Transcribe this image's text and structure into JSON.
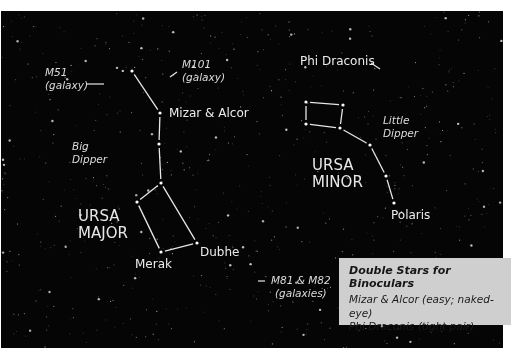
{
  "colors": {
    "sky": "#050505",
    "lines": "#e6e6e6",
    "label": "#e6e6e6",
    "info_box_bg": "#cfcfcf",
    "info_box_text": "#151515"
  },
  "labels": {
    "m51": [
      "M51",
      "(galaxy)"
    ],
    "m101": [
      "M101",
      "(galaxy)"
    ],
    "mizar_alcor": "Mizar & Alcor",
    "big_dipper": [
      "Big",
      "Dipper"
    ],
    "ursa_major": [
      "URSA",
      "MAJOR"
    ],
    "merak": "Merak",
    "dubhe": "Dubhe",
    "m81_m82": [
      "M81 & M82",
      "(galaxies)"
    ],
    "phi_draconis": "Phi Draconis",
    "little_dipper": [
      "Little",
      "Dipper"
    ],
    "ursa_minor": [
      "URSA",
      "MINOR"
    ],
    "polaris": "Polaris"
  },
  "info_box": {
    "title": "Double Stars for Binoculars",
    "lines": [
      "Mizar & Alcor (easy; naked-eye)",
      "Phi Draconis (tight pair)"
    ]
  },
  "constellations": {
    "big_dipper": {
      "stars": [
        [
          131,
          60
        ],
        [
          159,
          102
        ],
        [
          158,
          133
        ],
        [
          160,
          172
        ],
        [
          136,
          191
        ],
        [
          160,
          241
        ],
        [
          196,
          232
        ]
      ],
      "segments": [
        [
          0,
          1
        ],
        [
          1,
          2
        ],
        [
          2,
          3
        ],
        [
          3,
          4
        ],
        [
          4,
          5
        ],
        [
          5,
          6
        ],
        [
          6,
          3
        ]
      ]
    },
    "little_dipper": {
      "stars": [
        [
          305,
          91
        ],
        [
          342,
          94
        ],
        [
          339,
          117
        ],
        [
          305,
          113
        ],
        [
          369,
          134
        ],
        [
          385,
          165
        ],
        [
          393,
          192
        ]
      ],
      "segments": [
        [
          0,
          1
        ],
        [
          1,
          2
        ],
        [
          2,
          3
        ],
        [
          3,
          0
        ],
        [
          2,
          4
        ],
        [
          4,
          5
        ],
        [
          5,
          6
        ]
      ]
    }
  },
  "pointers": {
    "m51": [
      [
        86,
        73
      ],
      [
        103,
        73
      ]
    ],
    "m101": [
      [
        169,
        66
      ],
      [
        176,
        61
      ]
    ],
    "phi_draconis": [
      [
        370,
        52
      ],
      [
        379,
        58
      ]
    ],
    "m81_m82": [
      [
        257,
        270
      ],
      [
        264,
        270
      ]
    ]
  }
}
